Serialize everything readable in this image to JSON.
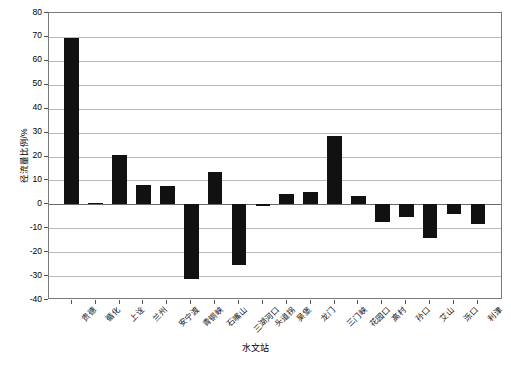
{
  "chart_data": {
    "type": "bar",
    "title": "",
    "xlabel": "水文站",
    "ylabel": "径流量比例/%",
    "ylim": [
      -40,
      80
    ],
    "ytick_step": 10,
    "yticks": [
      "80",
      "70",
      "60",
      "50",
      "40",
      "30",
      "20",
      "10",
      "0",
      "-10",
      "-20",
      "-30",
      "-40"
    ],
    "grid": true,
    "legend": "none",
    "bar_color": "#111111",
    "categories": [
      "贵德",
      "循化",
      "上诠",
      "兰州",
      "安宁渡",
      "青铜峡",
      "石嘴山",
      "三湖河口",
      "头道拐",
      "吴堡",
      "龙门",
      "三门峡",
      "花园口",
      "高村",
      "孙口",
      "艾山",
      "泺口",
      "利津"
    ],
    "values": [
      69.5,
      0.7,
      20.5,
      8.3,
      7.7,
      -31.3,
      13.5,
      -25.2,
      -0.7,
      4.4,
      5.0,
      28.7,
      3.6,
      -7.3,
      -5.4,
      -14.3,
      -4.2,
      -8.1
    ]
  }
}
